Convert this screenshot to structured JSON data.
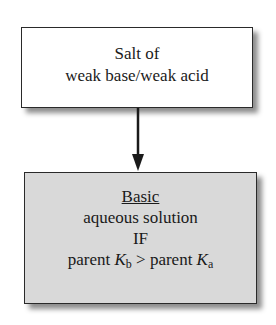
{
  "diagram": {
    "top_box": {
      "lines": [
        "Salt of",
        "weak base/weak acid"
      ]
    },
    "arrow": {
      "direction": "down"
    },
    "bottom_box": {
      "heading": "Basic",
      "line2": "aqueous solution",
      "line3": "IF",
      "condition": {
        "left_prefix": "parent ",
        "left_symbol": "K",
        "left_sub": "b",
        "operator": " > ",
        "right_prefix": "parent ",
        "right_symbol": "K",
        "right_sub": "a"
      },
      "fill_color": "#d9d9d9"
    }
  }
}
